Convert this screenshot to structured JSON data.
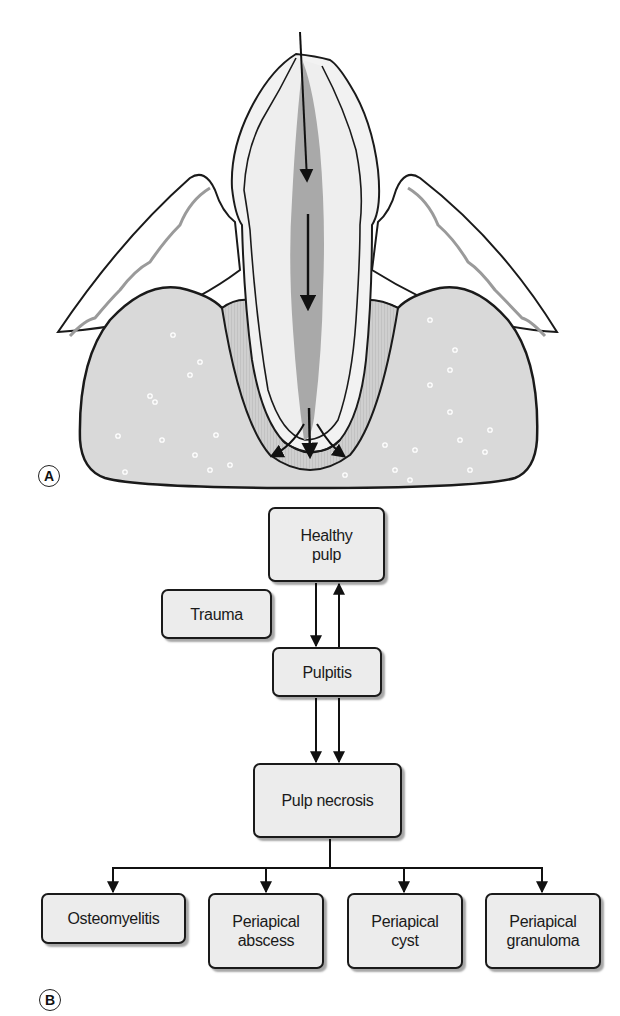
{
  "panel_a": {
    "label": "A",
    "description": "Tooth cross-section in alveolar bone; arrows show spread of infection down the pulp canal and out through the apex"
  },
  "panel_b": {
    "label": "B",
    "nodes": {
      "healthy_pulp": "Healthy\npulp",
      "trauma": "Trauma",
      "pulpitis": "Pulpitis",
      "pulp_necrosis": "Pulp necrosis",
      "osteomyelitis": "Osteomyelitis",
      "periapical_abscess": "Periapical\nabscess",
      "periapical_cyst": "Periapical\ncyst",
      "periapical_granuloma": "Periapical\ngranuloma"
    },
    "edges": [
      {
        "from": "Healthy pulp",
        "to": "Pulpitis"
      },
      {
        "from": "Pulpitis",
        "to": "Healthy pulp"
      },
      {
        "from": "Pulpitis",
        "to": "Pulp necrosis"
      },
      {
        "from": "Pulpitis",
        "to": "Pulp necrosis"
      },
      {
        "from": "Pulp necrosis",
        "to": "Osteomyelitis"
      },
      {
        "from": "Pulp necrosis",
        "to": "Periapical abscess"
      },
      {
        "from": "Pulp necrosis",
        "to": "Periapical cyst"
      },
      {
        "from": "Pulp necrosis",
        "to": "Periapical granuloma"
      }
    ]
  },
  "colors": {
    "box_fill": "#ececec",
    "bone_fill": "#d9d9d9",
    "pulp_fill": "#a9a9a9",
    "tooth_fill": "#eeeeee",
    "stroke": "#1a1a1a"
  }
}
